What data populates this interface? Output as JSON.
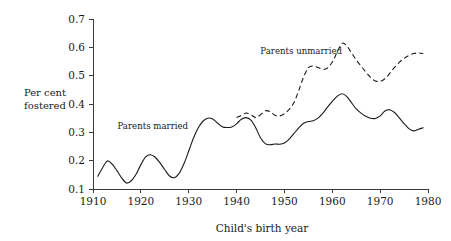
{
  "chart_data": {
    "type": "line",
    "title": "",
    "xlabel": "Child's birth year",
    "ylabel": "Per cent fostered",
    "ylabel_lines": [
      "Per cent",
      "fostered"
    ],
    "xlim": [
      1910,
      1980
    ],
    "ylim": [
      0.1,
      0.7
    ],
    "xticks": [
      1910,
      1920,
      1930,
      1940,
      1950,
      1960,
      1970,
      1980
    ],
    "xticklabels": [
      "1910",
      "1920",
      "1930",
      "1940",
      "1950",
      "1960",
      "1970",
      "1980"
    ],
    "yticks": [
      0.1,
      0.2,
      0.3,
      0.4,
      0.5,
      0.6,
      0.7
    ],
    "yticklabels": [
      "0.1",
      "0.2",
      "0.3",
      "0.4",
      "0.5",
      "0.6",
      "0.7"
    ],
    "grid": false,
    "legend": "inline-annotations",
    "line_color": "#1a1a1a",
    "series": [
      {
        "name": "Parents married",
        "style": "solid",
        "annotation": "Parents married",
        "annotation_x": 1922.5,
        "annotation_y": 0.312,
        "x": [
          1911,
          1912,
          1913,
          1914,
          1915,
          1916,
          1917,
          1918,
          1919,
          1920,
          1921,
          1922,
          1923,
          1924,
          1925,
          1926,
          1927,
          1928,
          1929,
          1930,
          1931,
          1932,
          1933,
          1934,
          1935,
          1936,
          1937,
          1938,
          1939,
          1940,
          1941,
          1942,
          1943,
          1944,
          1945,
          1946,
          1947,
          1948,
          1949,
          1950,
          1951,
          1952,
          1953,
          1954,
          1955,
          1956,
          1957,
          1958,
          1959,
          1960,
          1961,
          1962,
          1963,
          1964,
          1965,
          1966,
          1967,
          1968,
          1969,
          1970,
          1971,
          1972,
          1973,
          1974,
          1975,
          1976,
          1977,
          1978,
          1979
        ],
        "values": [
          0.145,
          0.175,
          0.199,
          0.188,
          0.165,
          0.139,
          0.121,
          0.129,
          0.152,
          0.186,
          0.213,
          0.221,
          0.212,
          0.192,
          0.168,
          0.146,
          0.14,
          0.155,
          0.189,
          0.234,
          0.28,
          0.316,
          0.34,
          0.35,
          0.347,
          0.333,
          0.32,
          0.317,
          0.319,
          0.33,
          0.346,
          0.352,
          0.343,
          0.316,
          0.281,
          0.26,
          0.256,
          0.259,
          0.258,
          0.262,
          0.276,
          0.296,
          0.316,
          0.332,
          0.338,
          0.341,
          0.35,
          0.367,
          0.389,
          0.409,
          0.427,
          0.436,
          0.427,
          0.405,
          0.383,
          0.368,
          0.357,
          0.35,
          0.349,
          0.358,
          0.375,
          0.38,
          0.37,
          0.351,
          0.331,
          0.313,
          0.305,
          0.311,
          0.316
        ]
      },
      {
        "name": "Parents unmarried",
        "style": "dashed",
        "annotation": "Parents unmarried",
        "annotation_x": 1953.5,
        "annotation_y": 0.575,
        "x": [
          1940,
          1941,
          1942,
          1943,
          1944,
          1945,
          1946,
          1947,
          1948,
          1949,
          1950,
          1951,
          1952,
          1953,
          1954,
          1955,
          1956,
          1957,
          1958,
          1959,
          1960,
          1961,
          1962,
          1963,
          1964,
          1965,
          1966,
          1967,
          1968,
          1969,
          1970,
          1971,
          1972,
          1973,
          1974,
          1975,
          1976,
          1977,
          1978,
          1979
        ],
        "values": [
          0.352,
          0.36,
          0.368,
          0.362,
          0.352,
          0.362,
          0.376,
          0.373,
          0.36,
          0.358,
          0.366,
          0.381,
          0.405,
          0.448,
          0.495,
          0.528,
          0.534,
          0.529,
          0.522,
          0.527,
          0.548,
          0.582,
          0.614,
          0.606,
          0.581,
          0.556,
          0.534,
          0.513,
          0.494,
          0.481,
          0.48,
          0.489,
          0.508,
          0.529,
          0.547,
          0.561,
          0.571,
          0.578,
          0.58,
          0.578
        ]
      }
    ]
  },
  "axes": {
    "y_axis_name": "percent-fostered-axis",
    "x_axis_name": "birth-year-axis"
  }
}
